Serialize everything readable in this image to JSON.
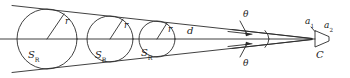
{
  "figure": {
    "type": "geometric-diagram",
    "stroke_color": "#2b2b2b",
    "background_color": "#ffffff"
  },
  "labels": {
    "radius_1": {
      "text": "r"
    },
    "radius_2": {
      "text": "r"
    },
    "radius_3": {
      "text": "r"
    },
    "area_1": {
      "base": "S",
      "sub": "R"
    },
    "area_2": {
      "base": "S",
      "sub": "R"
    },
    "area_3": {
      "base": "S",
      "sub": "R"
    },
    "distance": {
      "text": "d"
    },
    "angle_upper": {
      "text": "θ"
    },
    "angle_lower": {
      "text": "θ"
    },
    "aperture_1": {
      "base": "a",
      "sub": "1"
    },
    "aperture_2": {
      "base": "a",
      "sub": "2"
    },
    "camera_point": {
      "text": "C"
    }
  },
  "geometry": {
    "apex": {
      "x": 313,
      "y": 39
    },
    "axis_y": 39,
    "circles": [
      {
        "cx": 47,
        "cy": 39,
        "r": 30
      },
      {
        "cx": 110,
        "cy": 39,
        "r": 23
      },
      {
        "cx": 157,
        "cy": 39,
        "r": 18
      }
    ],
    "cone_upper_start": {
      "x": 14,
      "y": 6
    },
    "cone_lower_start": {
      "x": 14,
      "y": 72
    }
  }
}
